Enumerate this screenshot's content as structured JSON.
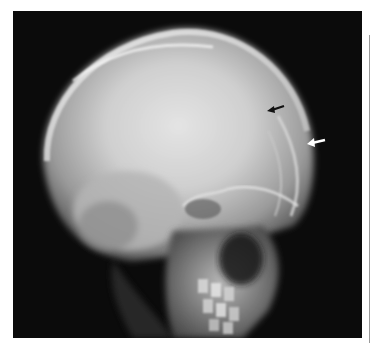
{
  "figure": {
    "type": "radiograph",
    "view": "lateral skull x-ray",
    "background_color": "#0b0b0b",
    "page_background": "#ffffff",
    "annotations": [
      {
        "id": "black-arrow",
        "color": "#111111",
        "direction": "pointing-left",
        "x": 276,
        "y": 107
      },
      {
        "id": "white-arrow",
        "color": "#ffffff",
        "direction": "pointing-left",
        "x": 316,
        "y": 141
      }
    ]
  }
}
